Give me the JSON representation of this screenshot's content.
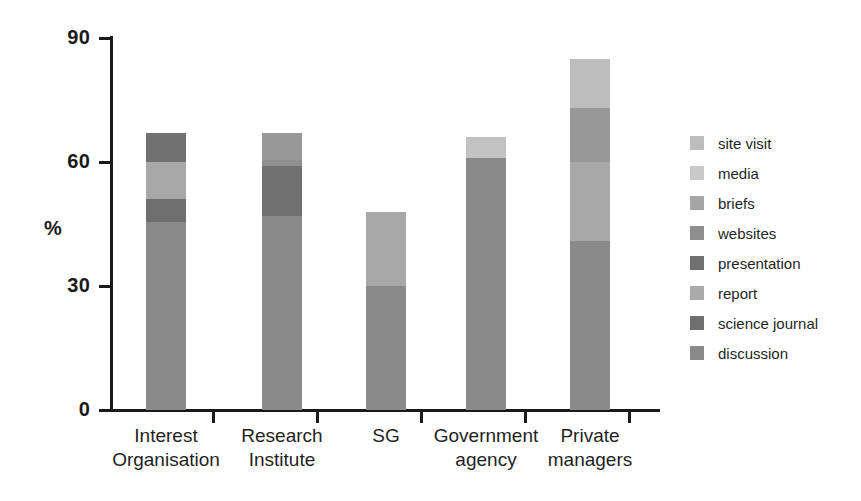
{
  "chart_data": {
    "type": "bar",
    "subtype": "stacked-bar",
    "title": "",
    "xlabel": "",
    "ylabel": "%",
    "ylim": [
      0,
      90
    ],
    "yticks": [
      0,
      30,
      60,
      90
    ],
    "ytick_labels": [
      "0",
      "30",
      "60",
      "90"
    ],
    "grid": false,
    "legend_position": "right",
    "categories": [
      "Interest Organisation",
      "Research Institute",
      "SG",
      "Government agency",
      "Private managers"
    ],
    "category_lines": [
      [
        "Interest",
        "Organisation"
      ],
      [
        "Research",
        "Institute"
      ],
      [
        "SG",
        ""
      ],
      [
        "Government",
        "agency"
      ],
      [
        "Private",
        "managers"
      ]
    ],
    "series": [
      {
        "name": "discussion",
        "color": "#8a8a8a",
        "values": [
          45.5,
          47,
          30,
          61,
          41
        ]
      },
      {
        "name": "science journal",
        "color": "#6e6e6e",
        "values": [
          5.5,
          0,
          0,
          0,
          0
        ]
      },
      {
        "name": "report",
        "color": "#a8a8a8",
        "values": [
          9,
          0,
          18,
          0,
          19
        ]
      },
      {
        "name": "presentation",
        "color": "#717171",
        "values": [
          7,
          12,
          0,
          0,
          0
        ]
      },
      {
        "name": "websites",
        "color": "#8f8f8f",
        "values": [
          0,
          1.5,
          0,
          0,
          0
        ]
      },
      {
        "name": "briefs",
        "color": "#989898",
        "values": [
          0,
          6.5,
          0,
          0,
          13
        ]
      },
      {
        "name": "media",
        "color": "#c2c2c2",
        "values": [
          0,
          0,
          0,
          5,
          0
        ]
      },
      {
        "name": "site visit",
        "color": "#bdbdbd",
        "values": [
          0,
          0,
          0,
          0,
          12
        ]
      }
    ],
    "totals": [
      67,
      67,
      48,
      66,
      85
    ]
  },
  "legend": {
    "items": [
      {
        "label": "site visit",
        "color": "#bdbdbd"
      },
      {
        "label": "media",
        "color": "#c8c8c8"
      },
      {
        "label": "briefs",
        "color": "#a6a6a6"
      },
      {
        "label": "websites",
        "color": "#8f8f8f"
      },
      {
        "label": "presentation",
        "color": "#717171"
      },
      {
        "label": "report",
        "color": "#aaaaaa"
      },
      {
        "label": "science journal",
        "color": "#6e6e6e"
      },
      {
        "label": "discussion",
        "color": "#8a8a8a"
      }
    ]
  },
  "axis": {
    "y_label": "%",
    "y_ticks": [
      "90",
      "60",
      "30",
      "0"
    ]
  },
  "colors": {
    "axis": "#1a1a1a",
    "background": "#ffffff",
    "text": "#1f1f1f"
  }
}
